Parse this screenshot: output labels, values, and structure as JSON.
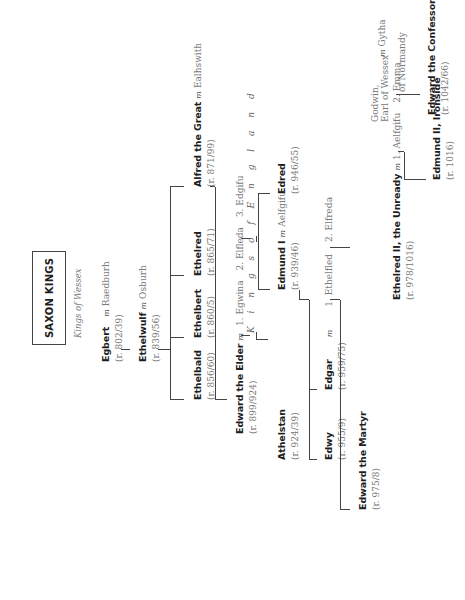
{
  "title": "SAXON KINGS",
  "subtitle": "Kings of Wessex",
  "section_label": "K i n g s   o f   E n g l a n d",
  "marriage_symbol": "m",
  "people": {
    "egbert": {
      "name": "Egbert",
      "reign": "(r. 802/39)",
      "spouse": "Raedburh"
    },
    "ethelwulf": {
      "name": "Ethelwulf",
      "reign": "(r. 839/56)",
      "spouse": "Osburh"
    },
    "ethelbald": {
      "name": "Ethelbald",
      "reign": "(r. 856/60)"
    },
    "ethelbert": {
      "name": "Ethelbert",
      "reign": "(r. 860/5)"
    },
    "ethelred": {
      "name": "Ethelred",
      "reign": "(r. 865/71)"
    },
    "alfred": {
      "name": "Alfred the Great",
      "reign": "(r. 871/99)",
      "spouse": "Ealhswith"
    },
    "edward_elder": {
      "name": "Edward the Elder",
      "reign": "(r. 899/924)",
      "spouses": [
        "1. Egwina",
        "2. Elfleda",
        "3. Edgifu"
      ]
    },
    "athelstan": {
      "name": "Athelstan",
      "reign": "(r. 924/39)"
    },
    "edmund1": {
      "name": "Edmund I",
      "reign": "(r. 939/46)",
      "spouse": "Aelfgifu"
    },
    "edred": {
      "name": "Edred",
      "reign": "(r. 946/55)"
    },
    "edwy": {
      "name": "Edwy",
      "reign": "(r. 955/9)"
    },
    "edgar": {
      "name": "Edgar",
      "reign": "(r. 959/75)",
      "spouses": [
        "1. Ethelfled",
        "2. Elfreda"
      ]
    },
    "edward_martyr": {
      "name": "Edward the Martyr",
      "reign": "(r. 975/8)"
    },
    "ethelred2": {
      "name": "Ethelred II, the Unready",
      "reign": "(r. 978/1016)",
      "spouses": [
        "1. Aelfgifu",
        "2. Emma"
      ],
      "spouse2_line2": "of Normandy"
    },
    "edmund2": {
      "name": "Edmund II, Ironside",
      "reign": "(r. 1016)"
    },
    "edward_confessor": {
      "name": "Edward the Confessor",
      "reign": "(r. 1042/66)",
      "spouse": "Edith"
    },
    "godwin": {
      "name_line1": "Godwin,",
      "name_line2": "Earl of Wessex",
      "spouse": "Gytha"
    },
    "harold2": {
      "name": "Harold II",
      "reign": "(r. 1066)"
    }
  }
}
